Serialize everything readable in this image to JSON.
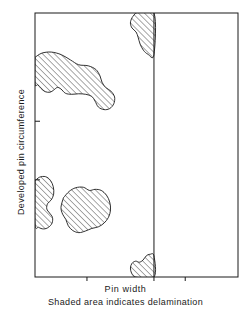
{
  "figure": {
    "title": "",
    "y_axis_label": "Developed pin circumference",
    "x_axis_label": "Pin width",
    "note": "Shaded area indicates delamination",
    "frame_color": "#1a1a1a",
    "hatch_color": "#1a1a1a",
    "background_color": "#ffffff"
  },
  "chart_data": {
    "type": "area",
    "title": "",
    "xlabel": "Pin width",
    "ylabel": "Developed pin circumference",
    "grid": false,
    "legend": null,
    "axis_tick_labels": {
      "x": [],
      "y": []
    },
    "plot_frame": {
      "x0": 35,
      "y0": 13,
      "x1": 238,
      "y1": 277
    },
    "xlim": [
      0,
      1
    ],
    "ylim": [
      0,
      1
    ],
    "annotations": [
      {
        "name": "pin-width-divider",
        "type": "vertical-line",
        "x": 0.586,
        "description": "Vertical line marking the pin width boundary"
      }
    ],
    "x_ticks": [
      0.256,
      0.586,
      0.74
    ],
    "y_ticks": [
      0.41,
      0.632
    ],
    "series": [
      {
        "name": "delamination-region-top",
        "kind": "hatched-polygon",
        "touches": [
          "top-edge",
          "pin-width-divider"
        ],
        "points": [
          [
            0.496,
            0.0
          ],
          [
            0.586,
            0.0
          ],
          [
            0.586,
            0.158
          ],
          [
            0.556,
            0.156
          ],
          [
            0.534,
            0.141
          ],
          [
            0.518,
            0.118
          ],
          [
            0.508,
            0.092
          ],
          [
            0.498,
            0.072
          ],
          [
            0.478,
            0.057
          ],
          [
            0.47,
            0.038
          ],
          [
            0.478,
            0.018
          ],
          [
            0.496,
            0.0
          ]
        ]
      },
      {
        "name": "delamination-region-upper-left",
        "kind": "hatched-polygon",
        "touches": [
          "left-edge"
        ],
        "points": [
          [
            0.0,
            0.168
          ],
          [
            0.034,
            0.152
          ],
          [
            0.08,
            0.148
          ],
          [
            0.13,
            0.158
          ],
          [
            0.175,
            0.178
          ],
          [
            0.215,
            0.196
          ],
          [
            0.262,
            0.2
          ],
          [
            0.3,
            0.214
          ],
          [
            0.32,
            0.238
          ],
          [
            0.33,
            0.262
          ],
          [
            0.348,
            0.282
          ],
          [
            0.374,
            0.296
          ],
          [
            0.392,
            0.318
          ],
          [
            0.388,
            0.344
          ],
          [
            0.368,
            0.362
          ],
          [
            0.34,
            0.366
          ],
          [
            0.312,
            0.356
          ],
          [
            0.296,
            0.334
          ],
          [
            0.28,
            0.316
          ],
          [
            0.25,
            0.308
          ],
          [
            0.215,
            0.306
          ],
          [
            0.18,
            0.308
          ],
          [
            0.15,
            0.304
          ],
          [
            0.128,
            0.288
          ],
          [
            0.11,
            0.282
          ],
          [
            0.092,
            0.292
          ],
          [
            0.074,
            0.3
          ],
          [
            0.05,
            0.298
          ],
          [
            0.03,
            0.286
          ],
          [
            0.014,
            0.272
          ],
          [
            0.0,
            0.268
          ],
          [
            0.0,
            0.168
          ]
        ]
      },
      {
        "name": "delamination-region-lower-left",
        "kind": "hatched-polygon",
        "touches": [
          "left-edge"
        ],
        "points": [
          [
            0.0,
            0.636
          ],
          [
            0.022,
            0.622
          ],
          [
            0.052,
            0.62
          ],
          [
            0.076,
            0.634
          ],
          [
            0.09,
            0.658
          ],
          [
            0.092,
            0.686
          ],
          [
            0.08,
            0.708
          ],
          [
            0.062,
            0.722
          ],
          [
            0.058,
            0.742
          ],
          [
            0.072,
            0.758
          ],
          [
            0.086,
            0.774
          ],
          [
            0.084,
            0.796
          ],
          [
            0.066,
            0.812
          ],
          [
            0.042,
            0.818
          ],
          [
            0.018,
            0.812
          ],
          [
            0.0,
            0.8
          ],
          [
            0.0,
            0.636
          ]
        ]
      },
      {
        "name": "delamination-region-lower-center",
        "kind": "hatched-polygon",
        "touches": [],
        "points": [
          [
            0.14,
            0.7
          ],
          [
            0.168,
            0.676
          ],
          [
            0.2,
            0.662
          ],
          [
            0.238,
            0.66
          ],
          [
            0.268,
            0.672
          ],
          [
            0.296,
            0.668
          ],
          [
            0.326,
            0.672
          ],
          [
            0.352,
            0.69
          ],
          [
            0.368,
            0.716
          ],
          [
            0.372,
            0.746
          ],
          [
            0.362,
            0.774
          ],
          [
            0.34,
            0.796
          ],
          [
            0.312,
            0.81
          ],
          [
            0.28,
            0.816
          ],
          [
            0.248,
            0.826
          ],
          [
            0.216,
            0.832
          ],
          [
            0.186,
            0.824
          ],
          [
            0.164,
            0.806
          ],
          [
            0.152,
            0.782
          ],
          [
            0.136,
            0.762
          ],
          [
            0.128,
            0.736
          ],
          [
            0.14,
            0.7
          ]
        ]
      },
      {
        "name": "delamination-region-bottom",
        "kind": "hatched-polygon",
        "touches": [
          "bottom-edge",
          "pin-width-divider"
        ],
        "points": [
          [
            0.49,
            1.0
          ],
          [
            0.586,
            1.0
          ],
          [
            0.586,
            0.92
          ],
          [
            0.566,
            0.914
          ],
          [
            0.548,
            0.92
          ],
          [
            0.532,
            0.936
          ],
          [
            0.514,
            0.944
          ],
          [
            0.496,
            0.94
          ],
          [
            0.478,
            0.948
          ],
          [
            0.47,
            0.966
          ],
          [
            0.476,
            0.986
          ],
          [
            0.49,
            1.0
          ]
        ]
      }
    ]
  }
}
